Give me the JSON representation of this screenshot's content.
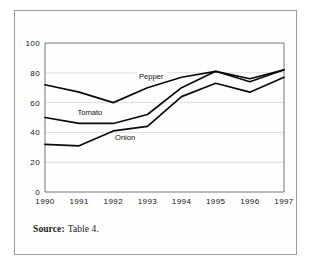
{
  "figure": {
    "source_label": "Source:",
    "source_value": "Table 4."
  },
  "chart_data": {
    "type": "line",
    "title": "",
    "xlabel": "",
    "ylabel": "",
    "categories": [
      "1990",
      "1991",
      "1992",
      "1993",
      "1994",
      "1995",
      "1996",
      "1997"
    ],
    "x": [
      1990,
      1991,
      1992,
      1993,
      1994,
      1995,
      1996,
      1997
    ],
    "ylim": [
      0,
      100
    ],
    "yticks": [
      0,
      20,
      40,
      60,
      80,
      100
    ],
    "ytick_labels": [
      "0",
      "20",
      "40",
      "60",
      "80",
      "100"
    ],
    "grid": true,
    "legend_position": "inline-annotations",
    "series": [
      {
        "name": "Pepper",
        "color": "#0a0a0a",
        "values": [
          72,
          67,
          60,
          70,
          77,
          81,
          76,
          82
        ],
        "label": "Pepper",
        "label_x": 1992.75,
        "label_y": 76
      },
      {
        "name": "Tomato",
        "color": "#0a0a0a",
        "values": [
          50,
          46,
          46,
          52,
          70,
          81,
          74,
          82
        ],
        "label": "Tomato",
        "label_x": 1990.95,
        "label_y": 52
      },
      {
        "name": "Onion",
        "color": "#0a0a0a",
        "values": [
          32,
          31,
          41,
          44,
          64,
          73,
          67,
          77
        ],
        "label": "Onion",
        "label_x": 1992.05,
        "label_y": 35
      }
    ],
    "annotations": [
      "Pepper",
      "Tomato",
      "Onion"
    ]
  }
}
